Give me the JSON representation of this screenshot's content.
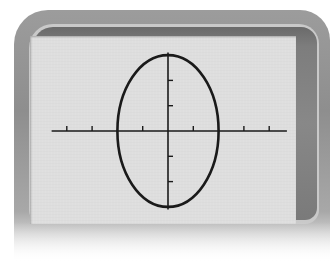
{
  "device": {
    "type": "graphing-calculator-screen",
    "screen_color": "#dedede",
    "bezel_color": "#808080",
    "curve_color": "#1a1a1a"
  },
  "chart_data": {
    "type": "line",
    "title": "",
    "xlabel": "",
    "ylabel": "",
    "curve": "ellipse",
    "equation": "x^2/4 + y^2/9 = 1",
    "center": [
      0,
      0
    ],
    "semi_axis_x": 2,
    "semi_axis_y": 3,
    "xlim": [
      -4.6,
      4.7
    ],
    "ylim": [
      -3.1,
      3.1
    ],
    "x_ticks": [
      -4,
      -3,
      -1,
      1,
      3,
      4
    ],
    "y_ticks": [
      -2,
      -1,
      1,
      2
    ],
    "tick_labels_shown": false,
    "grid": false,
    "legend": null,
    "pixel_mapping": {
      "origin_px": [
        168,
        131
      ],
      "units_per_px": 0.0396,
      "px_per_unit": 25.3
    }
  }
}
